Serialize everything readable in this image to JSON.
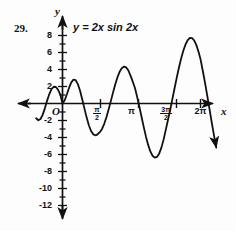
{
  "figure": {
    "problem_number": "29.",
    "equation_prefix": "y",
    "equation_rel": " = ",
    "equation_body": "2x sin 2x",
    "equation_full": "y = 2x sin 2x",
    "y_axis_label": "y",
    "x_axis_label": "x",
    "origin_label": "O"
  },
  "chart_data": {
    "type": "line",
    "title": "y = 2x sin 2x",
    "xlabel": "x",
    "ylabel": "y",
    "function": "y = 2x sin 2x",
    "xlim": [
      -1.2,
      7.2
    ],
    "ylim": [
      -13,
      9
    ],
    "grid": false,
    "legend": "none",
    "x_tick_labels": [
      "π/2",
      "π",
      "3π/2",
      "2π"
    ],
    "x_tick_values": [
      1.5708,
      3.1416,
      4.7124,
      6.2832
    ],
    "x_tick_display": [
      {
        "type": "fraction",
        "numerator": "π",
        "denominator": "2",
        "value": 1.5708
      },
      {
        "type": "whole",
        "text": "π",
        "value": 3.1416
      },
      {
        "type": "fraction",
        "numerator": "3π",
        "denominator": "2",
        "value": 4.7124
      },
      {
        "type": "whole",
        "text": "2π",
        "value": 6.2832
      }
    ],
    "y_tick_labels": [
      "8",
      "6",
      "4",
      "2",
      "-2",
      "-4",
      "-6",
      "-8",
      "-10",
      "-12"
    ],
    "y_tick_values": [
      8,
      6,
      4,
      2,
      -2,
      -4,
      -6,
      -8,
      -10,
      -12
    ],
    "y_minor_tick_step": 1,
    "axis_arrows": [
      "left",
      "up",
      "right",
      "down"
    ],
    "curve_end_arrow": "up",
    "curve_color": "#111111",
    "axis_color": "#111111",
    "key_points": [
      {
        "x": -1.15,
        "y": -1.05,
        "label": "left-end-below-axis"
      },
      {
        "x": -0.78,
        "y": 1.93,
        "label": "local-max-left"
      },
      {
        "x": 0.0,
        "y": 0.0,
        "label": "origin-zero"
      },
      {
        "x": 0.79,
        "y": 1.85,
        "label": "local-max-1"
      },
      {
        "x": 1.5708,
        "y": 0.0,
        "label": "zero-at-pi/2"
      },
      {
        "x": 2.25,
        "y": -4.8,
        "label": "local-min-1"
      },
      {
        "x": 3.1416,
        "y": 0.0,
        "label": "zero-at-pi"
      },
      {
        "x": 3.93,
        "y": 7.7,
        "label": "local-max-2"
      },
      {
        "x": 4.7124,
        "y": 0.0,
        "label": "zero-at-3pi/2"
      },
      {
        "x": 5.5,
        "y": -11.0,
        "label": "local-min-2"
      },
      {
        "x": 6.2832,
        "y": 0.0,
        "label": "zero-at-2pi"
      },
      {
        "x": 6.95,
        "y": 8.9,
        "label": "rising-arrow-end"
      }
    ],
    "x": [
      -1.2,
      -1.1,
      -1.0,
      -0.9,
      -0.8,
      -0.7,
      -0.6,
      -0.5,
      -0.4,
      -0.3,
      -0.2,
      -0.1,
      0.0,
      0.1,
      0.2,
      0.3,
      0.4,
      0.5,
      0.6,
      0.7,
      0.8,
      0.9,
      1.0,
      1.1,
      1.2,
      1.3,
      1.4,
      1.5,
      1.5708,
      1.7,
      1.8,
      1.9,
      2.0,
      2.1,
      2.2,
      2.3,
      2.4,
      2.5,
      2.6,
      2.7,
      2.8,
      2.9,
      3.0,
      3.1416,
      3.3,
      3.4,
      3.5,
      3.6,
      3.7,
      3.8,
      3.9,
      4.0,
      4.1,
      4.2,
      4.3,
      4.4,
      4.5,
      4.6,
      4.7124,
      4.9,
      5.0,
      5.1,
      5.2,
      5.3,
      5.4,
      5.5,
      5.6,
      5.7,
      5.8,
      5.9,
      6.0,
      6.1,
      6.2,
      6.2832,
      6.4,
      6.5,
      6.6,
      6.7,
      6.8,
      6.9,
      7.0
    ],
    "y": [
      -1.74,
      -1.97,
      -1.82,
      -1.31,
      -0.54,
      0.34,
      1.11,
      1.68,
      1.97,
      1.94,
      1.61,
      1.05,
      0.0,
      0.39,
      1.09,
      1.86,
      2.49,
      2.81,
      2.74,
      2.28,
      1.49,
      0.48,
      -0.6,
      -1.66,
      -2.56,
      -3.23,
      -3.63,
      -3.74,
      -3.68,
      -3.37,
      -2.99,
      -2.39,
      -1.61,
      -0.7,
      0.28,
      1.28,
      2.23,
      3.07,
      3.73,
      4.16,
      4.34,
      4.24,
      3.88,
      2.98,
      1.82,
      0.75,
      -0.39,
      -1.59,
      -2.78,
      -3.9,
      -4.87,
      -5.64,
      -6.15,
      -6.37,
      -6.29,
      -5.9,
      -5.22,
      -4.28,
      -2.99,
      -0.79,
      0.48,
      1.76,
      3.02,
      4.2,
      5.28,
      6.2,
      6.94,
      7.45,
      7.71,
      7.7,
      7.41,
      6.84,
      6.02,
      5.22,
      3.68,
      2.28,
      0.78,
      -0.76,
      -2.3,
      -3.79,
      -5.19
    ]
  }
}
